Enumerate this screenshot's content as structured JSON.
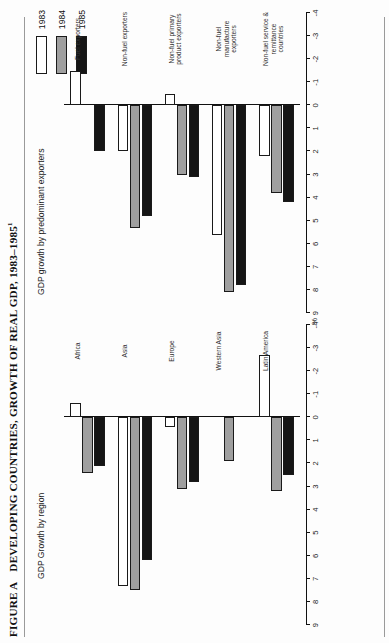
{
  "figure": {
    "number_label": "FIGURE A",
    "title": "DEVELOPING COUNTRIES, GROWTH OF REAL GDP, 1983–1985",
    "footnote_marker": "1",
    "unit_label": "%"
  },
  "legend": {
    "items": [
      {
        "label": "1983",
        "swatch": "white-outline",
        "color": "#ffffff"
      },
      {
        "label": "1984",
        "swatch": "gray-filled",
        "color": "#9f9f9f"
      },
      {
        "label": "1985",
        "swatch": "black-filled",
        "color": "#151515"
      }
    ]
  },
  "panels": {
    "left": {
      "title": "GDP Growth by region"
    },
    "right": {
      "title": "GDP growth by predominant exporters"
    }
  },
  "axis": {
    "ticks": [
      "9",
      "8",
      "7",
      "6",
      "5",
      "4",
      "3",
      "2",
      "1",
      "0",
      "-1",
      "-2",
      "-3",
      "-4"
    ],
    "min": -4,
    "max": 9
  },
  "chart_data": [
    {
      "type": "bar",
      "title": "GDP Growth by region",
      "xlabel": "",
      "ylabel": "%",
      "ylim": [
        -4,
        9
      ],
      "grid": false,
      "legend_position": "top-right",
      "categories": [
        "Africa",
        "Asia",
        "Europe",
        "Western Asia",
        "Latin America"
      ],
      "series": [
        {
          "name": "1983",
          "color": "#ffffff",
          "values": [
            -0.6,
            7.3,
            0.4,
            0.0,
            -2.7
          ]
        },
        {
          "name": "1984",
          "color": "#9f9f9f",
          "values": [
            2.4,
            7.5,
            3.1,
            1.9,
            3.2
          ]
        },
        {
          "name": "1985",
          "color": "#151515",
          "values": [
            2.1,
            6.2,
            2.8,
            0.0,
            2.5
          ]
        }
      ]
    },
    {
      "type": "bar",
      "title": "GDP growth by predominant exporters",
      "xlabel": "",
      "ylabel": "%",
      "ylim": [
        -4,
        9
      ],
      "grid": false,
      "legend_position": "top-right",
      "categories": [
        "Fuel exporters",
        "Non-fuel exporters",
        "Non-fuel primary product exporters",
        "Non-fuel manufacture exporters",
        "Non-fuel service & remittance countries"
      ],
      "series": [
        {
          "name": "1983",
          "color": "#ffffff",
          "values": [
            -1.5,
            2.0,
            -0.5,
            5.6,
            2.2
          ]
        },
        {
          "name": "1984",
          "color": "#9f9f9f",
          "values": [
            0.0,
            5.3,
            3.0,
            8.1,
            3.8
          ]
        },
        {
          "name": "1985",
          "color": "#151515",
          "values": [
            2.0,
            4.8,
            3.1,
            7.8,
            4.2
          ]
        }
      ]
    }
  ]
}
